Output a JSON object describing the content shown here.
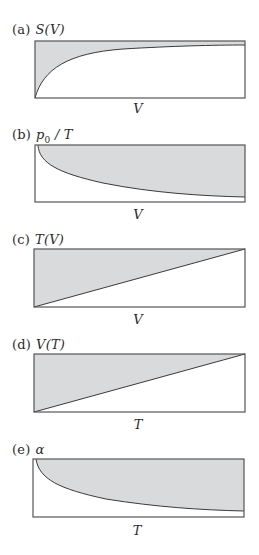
{
  "figure": {
    "fill_color": "#d9dadc",
    "line_color": "#3a3a3a",
    "panels": [
      {
        "letter": "(a)",
        "quantity": "S(V)",
        "xlabel": "V",
        "shape": "concave-increasing",
        "shaded": "above-curve"
      },
      {
        "letter": "(b)",
        "quantity": "p0 / T",
        "quantity_main": "p",
        "quantity_sub": "0",
        "quantity_rest": " / T",
        "xlabel": "V",
        "shape": "decreasing-hyperbola",
        "shaded": "above-curve"
      },
      {
        "letter": "(c)",
        "quantity": "T(V)",
        "xlabel": "V",
        "shape": "linear-increasing",
        "shaded": "above-line"
      },
      {
        "letter": "(d)",
        "quantity": "V(T)",
        "xlabel": "T",
        "shape": "linear-increasing",
        "shaded": "above-line"
      },
      {
        "letter": "(e)",
        "quantity": "α",
        "xlabel": "T",
        "shape": "decreasing-hyperbola",
        "shaded": "above-curve"
      }
    ]
  }
}
